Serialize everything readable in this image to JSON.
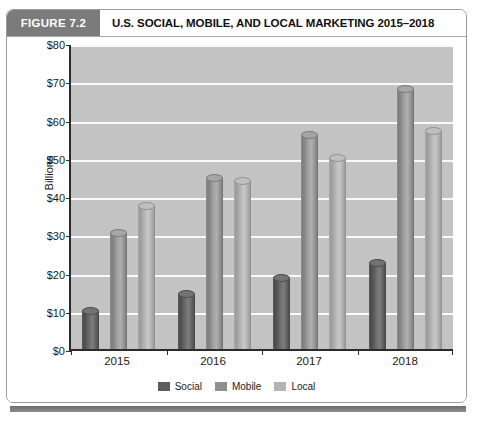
{
  "figure": {
    "badge_label": "FIGURE 7.2",
    "title": "U.S. SOCIAL, MOBILE, AND LOCAL MARKETING 2015–2018"
  },
  "chart_data": {
    "type": "bar",
    "title": "U.S. SOCIAL, MOBILE, AND LOCAL MARKETING 2015–2018",
    "xlabel": "",
    "ylabel": "Billions",
    "categories": [
      "2015",
      "2016",
      "2017",
      "2018"
    ],
    "series": [
      {
        "name": "Social",
        "values": [
          11,
          15.5,
          19.5,
          23.5
        ],
        "color": "#5d5d5d"
      },
      {
        "name": "Mobile",
        "values": [
          31.5,
          45.8,
          57,
          69
        ],
        "color": "#8f8f8f"
      },
      {
        "name": "Local",
        "values": [
          38.5,
          45,
          51,
          58
        ],
        "color": "#b4b4b4"
      }
    ],
    "ylim": [
      0,
      80
    ],
    "y_ticks": [
      "$0",
      "$10",
      "$20",
      "$30",
      "$40",
      "$50",
      "$60",
      "$70",
      "$80"
    ],
    "y_tick_values": [
      0,
      10,
      20,
      30,
      40,
      50,
      60,
      70,
      80
    ],
    "grid": true,
    "legend_position": "bottom"
  },
  "legend": {
    "items": [
      {
        "label": "Social"
      },
      {
        "label": "Mobile"
      },
      {
        "label": "Local"
      }
    ]
  },
  "footer": {
    "caption_fragment": "cut-off caption text"
  }
}
